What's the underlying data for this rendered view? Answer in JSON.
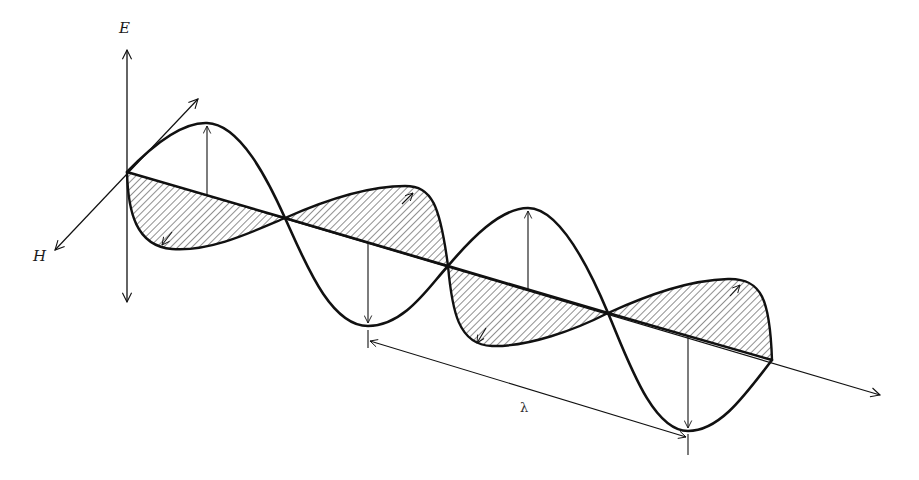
{
  "figure": {
    "labels": {
      "e_axis": "E",
      "h_axis": "H",
      "wavelength": "λ"
    },
    "colors": {
      "ink": "#111111",
      "background": "#ffffff",
      "hatch": "#333333"
    },
    "components": [
      {
        "name": "electric-field-wave",
        "description": "Vertical sinusoid (unshaded)"
      },
      {
        "name": "magnetic-field-wave",
        "description": "Horizontal sinusoid drawn in perspective (hatched)"
      },
      {
        "name": "propagation-axis",
        "description": "Direction of travel arrow"
      },
      {
        "name": "wavelength-dimension",
        "description": "Double-headed arrow between consecutive E troughs labeled λ"
      }
    ]
  }
}
